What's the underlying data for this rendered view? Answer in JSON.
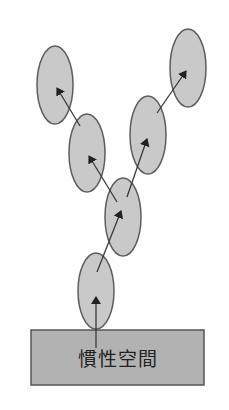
{
  "diagram": {
    "base": {
      "label": "慣性空間",
      "x": 31,
      "y": 330,
      "width": 173,
      "height": 55
    },
    "nodes": [
      {
        "id": "n1",
        "cx": 96,
        "cy": 291,
        "rx": 18,
        "ry": 38
      },
      {
        "id": "n2",
        "cx": 123,
        "cy": 217,
        "rx": 18,
        "ry": 39
      },
      {
        "id": "n3",
        "cx": 87,
        "cy": 153,
        "rx": 18,
        "ry": 39
      },
      {
        "id": "n4",
        "cx": 55,
        "cy": 85,
        "rx": 18,
        "ry": 39
      },
      {
        "id": "n5",
        "cx": 148,
        "cy": 135,
        "rx": 18,
        "ry": 39
      },
      {
        "id": "n6",
        "cx": 188,
        "cy": 68,
        "rx": 18,
        "ry": 39
      }
    ],
    "arrows": [
      {
        "from": "base",
        "to": "n1",
        "x1": 96,
        "y1": 348,
        "x2": 96,
        "y2": 297
      },
      {
        "from": "n1",
        "to": "n2",
        "x1": 97,
        "y1": 272,
        "x2": 121,
        "y2": 211
      },
      {
        "from": "n2",
        "to": "n3",
        "x1": 117,
        "y1": 202,
        "x2": 89,
        "y2": 156
      },
      {
        "from": "n3",
        "to": "n4",
        "x1": 80,
        "y1": 126,
        "x2": 57,
        "y2": 88
      },
      {
        "from": "n2",
        "to": "n5",
        "x1": 127,
        "y1": 197,
        "x2": 147,
        "y2": 139
      },
      {
        "from": "n5",
        "to": "n6",
        "x1": 157,
        "y1": 113,
        "x2": 186,
        "y2": 71
      }
    ],
    "colors": {
      "node_fill": "#c9c9c9",
      "node_stroke": "#5e5e5e",
      "base_fill": "#b2b2b2",
      "base_stroke": "#555555",
      "arrow": "#3a3a3a"
    }
  }
}
